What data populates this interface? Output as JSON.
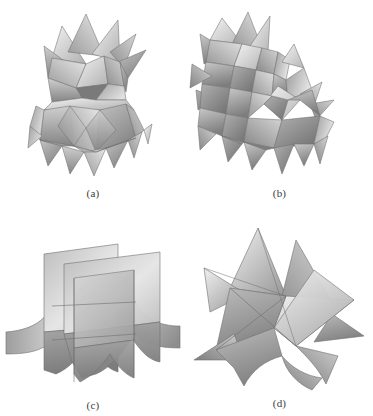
{
  "figure": {
    "background_color": "#ffffff",
    "rendering_style": "grayscale shaded polyhedra",
    "layout": "2x2 grid of labeled panels",
    "panels": [
      {
        "id": "a",
        "label": "(a)",
        "subject": "stellated polyhedron with upper spiked crown and lower faceted drum",
        "spike_count": 16
      },
      {
        "id": "b",
        "label": "(b)",
        "subject": "stellated polyhedron viewed obliquely with offset clustered spikes",
        "spike_count": 18
      },
      {
        "id": "c",
        "label": "(c)",
        "subject": "three mutually perpendicular intersecting planes with concave star edges",
        "plane_count": 3
      },
      {
        "id": "d",
        "label": "(d)",
        "subject": "six-pointed star figure formed by intersecting triangular sheets",
        "point_count": 6
      }
    ]
  },
  "palette": {
    "face_light": "#e4e4e4",
    "face_mid": "#b4b4b4",
    "face_dark": "#8e8e8e",
    "face_darker": "#767676",
    "edge": "#6f6f6f",
    "label_color": "#3d3d3d"
  }
}
